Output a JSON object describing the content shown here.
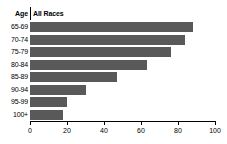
{
  "chart_data": {
    "type": "bar",
    "orientation": "horizontal",
    "title": "",
    "xlabel": "",
    "ylabel": "Age",
    "categories": [
      "65-69",
      "70-74",
      "75-79",
      "80-84",
      "85-89",
      "90-94",
      "95-99",
      "100+"
    ],
    "series": [
      {
        "name": "All Races",
        "values": [
          88,
          84,
          76,
          63,
          47,
          30,
          20,
          18
        ]
      }
    ],
    "xlim": [
      0,
      100
    ],
    "xticks": [
      0,
      20,
      40,
      60,
      80,
      100
    ],
    "xtick_labels": [
      "0",
      "20",
      "40",
      "60",
      "80",
      "100"
    ],
    "grid": false,
    "legend": "none",
    "bar_color": "#595959",
    "background_color": "#ffffff",
    "axis_color": "#000000"
  },
  "header": {
    "category_label": "Age",
    "series_label": "All Races"
  }
}
